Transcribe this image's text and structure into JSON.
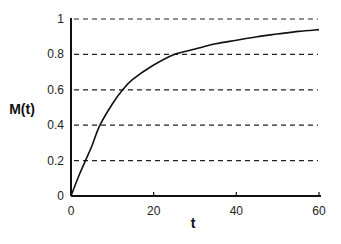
{
  "chart_data": {
    "type": "line",
    "title": "",
    "xlabel": "t",
    "ylabel": "M(t)",
    "xlim": [
      0,
      60
    ],
    "ylim": [
      0,
      1
    ],
    "xticks": [
      "0",
      "20",
      "40",
      "60"
    ],
    "yticks": [
      "0",
      "0.2",
      "0.4",
      "0.6",
      "0.8",
      "1"
    ],
    "grid": "horizontal dashed at 0.2, 0.4, 0.6, 0.8, 1",
    "legend": null,
    "series": [
      {
        "name": "M(t)",
        "x": [
          0,
          2,
          3.5,
          5,
          7,
          10,
          12.5,
          15,
          20,
          25,
          30,
          35,
          40,
          45,
          50,
          55,
          60
        ],
        "values": [
          0,
          0.12,
          0.2,
          0.28,
          0.4,
          0.52,
          0.6,
          0.66,
          0.74,
          0.8,
          0.83,
          0.86,
          0.88,
          0.9,
          0.915,
          0.93,
          0.94
        ]
      }
    ]
  }
}
